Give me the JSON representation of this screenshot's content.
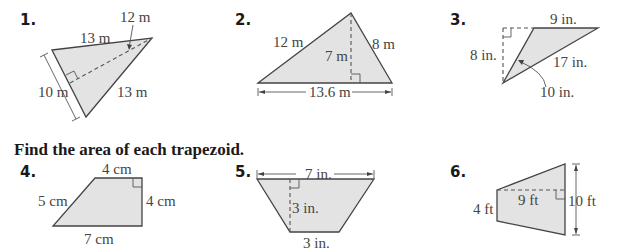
{
  "section1": {
    "problems": [
      {
        "number": "1.",
        "labels": {
          "top_side": "13 m",
          "height": "12 m",
          "left_side": "10 m",
          "right_side": "13 m"
        }
      },
      {
        "number": "2.",
        "labels": {
          "left_side": "12 m",
          "right_side": "8 m",
          "height": "7 m",
          "base": "13.6 m"
        }
      },
      {
        "number": "3.",
        "labels": {
          "top": "9 in.",
          "height": "8 in.",
          "long_side": "17 in.",
          "short_side": "10 in."
        }
      }
    ]
  },
  "section2": {
    "heading": "Find the area of each trapezoid.",
    "problems": [
      {
        "number": "4.",
        "labels": {
          "top": "4 cm",
          "left_side": "5 cm",
          "right_side": "4 cm",
          "bottom": "7 cm"
        }
      },
      {
        "number": "5.",
        "labels": {
          "top": "7 in.",
          "height": "3 in.",
          "bottom": "3 in."
        }
      },
      {
        "number": "6.",
        "labels": {
          "left": "4 ft",
          "height": "9 ft",
          "right": "10 ft"
        }
      }
    ]
  }
}
